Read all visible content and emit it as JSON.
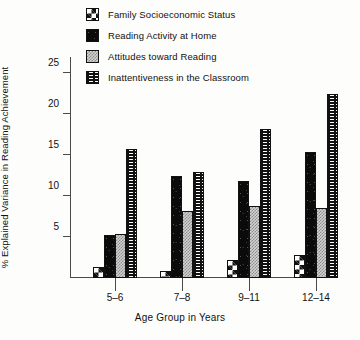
{
  "chart_data": {
    "type": "bar",
    "title": "",
    "xlabel": "Age Group in Years",
    "ylabel": "% Explained Variance in Reading Achievement",
    "categories": [
      "5–6",
      "7–8",
      "9–11",
      "12–14"
    ],
    "ylim": [
      0,
      27
    ],
    "yticks": [
      5,
      10,
      15,
      20,
      25
    ],
    "grid": false,
    "legend_position": "top",
    "series": [
      {
        "name": "Family Socioeconomic Status",
        "pattern": "checkerboard",
        "values": [
          1.3,
          0.8,
          2.2,
          2.8
        ]
      },
      {
        "name": "Reading Activity at Home",
        "pattern": "solid-black",
        "values": [
          5.2,
          12.5,
          11.9,
          15.4
        ]
      },
      {
        "name": "Attitudes toward Reading",
        "pattern": "light-dots",
        "values": [
          5.4,
          8.2,
          8.8,
          8.6
        ]
      },
      {
        "name": "Inattentiveness in the Classroom",
        "pattern": "basket-weave",
        "values": [
          15.8,
          13.0,
          18.2,
          22.5
        ]
      }
    ]
  },
  "colors": {
    "axis": "#4a4a4a",
    "ink": "#111111",
    "background": "#fdfdfb",
    "dots_fill": "#d2d2d2"
  }
}
